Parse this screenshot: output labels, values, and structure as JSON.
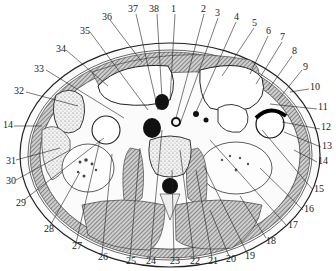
{
  "figure": {
    "labels": [
      {
        "id": "1",
        "x": 171,
        "y": 6
      },
      {
        "id": "2",
        "x": 201,
        "y": 6
      },
      {
        "id": "3",
        "x": 215,
        "y": 10
      },
      {
        "id": "4",
        "x": 234,
        "y": 14
      },
      {
        "id": "5",
        "x": 252,
        "y": 20
      },
      {
        "id": "6",
        "x": 266,
        "y": 28
      },
      {
        "id": "7",
        "x": 280,
        "y": 34
      },
      {
        "id": "8",
        "x": 292,
        "y": 48
      },
      {
        "id": "9",
        "x": 303,
        "y": 64
      },
      {
        "id": "10",
        "x": 310,
        "y": 84
      },
      {
        "id": "11",
        "x": 318,
        "y": 104
      },
      {
        "id": "12",
        "x": 321,
        "y": 124
      },
      {
        "id": "13",
        "x": 322,
        "y": 143
      },
      {
        "id": "14",
        "x": 318,
        "y": 158
      },
      {
        "id": "15",
        "x": 314,
        "y": 186
      },
      {
        "id": "16",
        "x": 304,
        "y": 206
      },
      {
        "id": "17",
        "x": 288,
        "y": 222
      },
      {
        "id": "18",
        "x": 266,
        "y": 238
      },
      {
        "id": "19",
        "x": 245,
        "y": 253
      },
      {
        "id": "20",
        "x": 226,
        "y": 256
      },
      {
        "id": "21",
        "x": 208,
        "y": 258
      },
      {
        "id": "22",
        "x": 190,
        "y": 258
      },
      {
        "id": "23",
        "x": 170,
        "y": 258
      },
      {
        "id": "24",
        "x": 146,
        "y": 258
      },
      {
        "id": "25",
        "x": 126,
        "y": 258
      },
      {
        "id": "26",
        "x": 98,
        "y": 254
      },
      {
        "id": "27",
        "x": 72,
        "y": 243
      },
      {
        "id": "28",
        "x": 44,
        "y": 226
      },
      {
        "id": "29",
        "x": 18,
        "y": 200
      },
      {
        "id": "30",
        "x": 8,
        "y": 178
      },
      {
        "id": "31",
        "x": 8,
        "y": 158
      },
      {
        "id": "32",
        "x": 16,
        "y": 88
      },
      {
        "id": "14L",
        "text": "14",
        "x": 5,
        "y": 122
      },
      {
        "id": "33",
        "x": 36,
        "y": 66
      },
      {
        "id": "34",
        "x": 58,
        "y": 46
      },
      {
        "id": "35",
        "x": 82,
        "y": 28
      },
      {
        "id": "36",
        "x": 104,
        "y": 14
      },
      {
        "id": "37",
        "x": 130,
        "y": 6
      },
      {
        "id": "38",
        "x": 151,
        "y": 6
      }
    ]
  }
}
